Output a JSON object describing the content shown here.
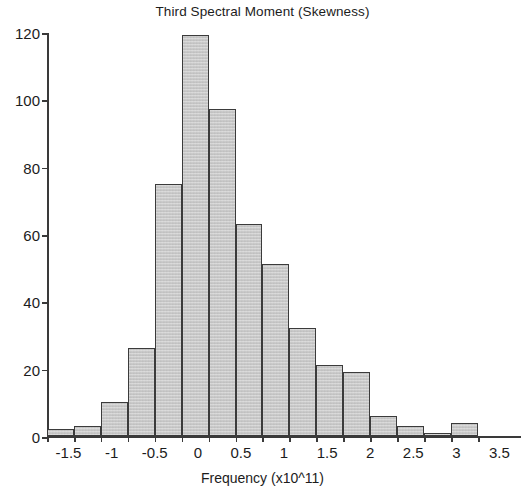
{
  "chart_data": {
    "type": "bar",
    "title": "Third Spectral Moment (Skewness)",
    "subtitle": "",
    "xlabel": "Frequency (x10^11)",
    "ylabel": "",
    "categories": [
      -1.75,
      -1.5,
      -1.25,
      -1,
      -0.75,
      -0.5,
      -0.25,
      0,
      0.25,
      0.5,
      0.75,
      1,
      1.25,
      1.5,
      1.75,
      2
    ],
    "bin_centers": [
      -1.5,
      -1.25,
      -1,
      -0.75,
      -0.5,
      -0.25,
      0,
      0.25,
      0.5,
      0.75,
      1,
      1.25,
      1.5,
      1.75,
      2,
      2.25
    ],
    "bin_edges": [
      -1.75,
      -1.4375,
      -1.125,
      -0.8125,
      -0.5,
      -0.1875,
      0.125,
      0.4375,
      0.75,
      1.0625,
      1.375,
      1.6875,
      2.0,
      2.3125,
      2.625,
      2.9375,
      3.25
    ],
    "values": [
      2,
      3,
      10,
      26,
      75,
      119,
      97,
      63,
      51,
      32,
      21,
      19,
      6,
      3,
      1,
      4
    ],
    "bar_labels": [
      "-1.5",
      "-1",
      "-0.5",
      "0",
      "0.5",
      "1",
      "1.5",
      "2",
      "2.5",
      "3",
      "3.5"
    ],
    "xtick_labels": [
      "-1.5",
      "-1",
      "-0.5",
      "0",
      "0.5",
      "1",
      "1.5",
      "2",
      "2.5",
      "3",
      "3.5"
    ],
    "xtick_values": [
      -1.5,
      -1,
      -0.5,
      0,
      0.5,
      1,
      1.5,
      2,
      2.5,
      3,
      3.5
    ],
    "ytick_labels": [
      "0",
      "20",
      "40",
      "60",
      "80",
      "100",
      "120"
    ],
    "ytick_values": [
      0,
      20,
      40,
      60,
      80,
      100,
      120
    ],
    "ylim": [
      0,
      120
    ],
    "xlim": [
      -1.75,
      3.75
    ],
    "grid": false,
    "legend": null,
    "bar_fill_color": "#c9c9c9",
    "bar_edge_color": "#3b3b3b",
    "axis_color": "#3a3a3a",
    "text_color": "#1c1c1c",
    "background_color": "#ffffff"
  }
}
